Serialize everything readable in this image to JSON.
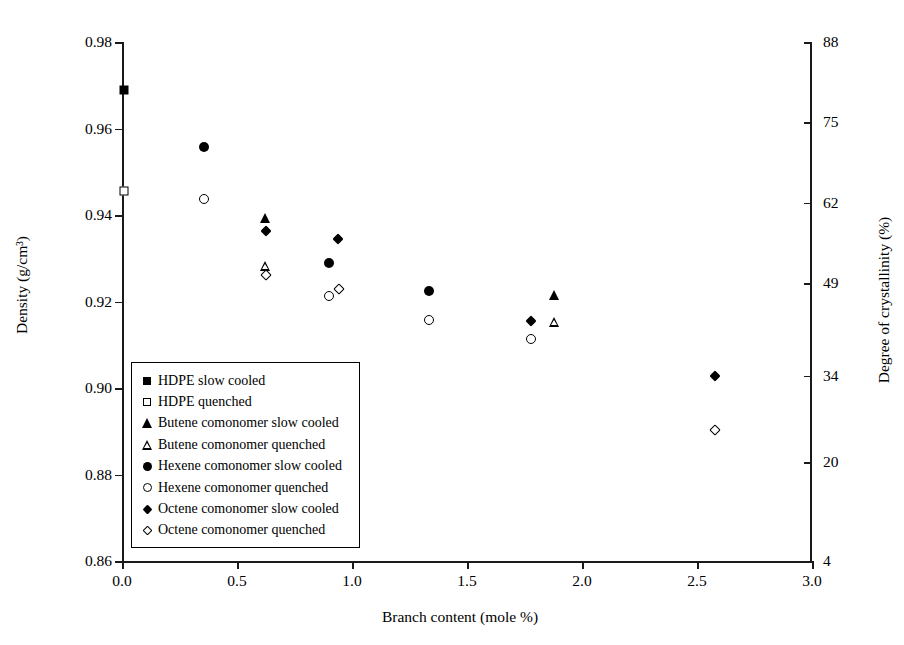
{
  "chart_data": {
    "type": "scatter",
    "title": "",
    "xlabel": "Branch content (mole %)",
    "ylabel": "Density (g/cm³)",
    "y2label": "Degree of crystallinity (%)",
    "xlim": [
      0.0,
      3.0
    ],
    "ylim": [
      0.86,
      0.98
    ],
    "y2lim": [
      4,
      88
    ],
    "xticks": [
      "0.0",
      "0.5",
      "1.0",
      "1.5",
      "2.0",
      "2.5",
      "3.0"
    ],
    "xtick_values": [
      0.0,
      0.5,
      1.0,
      1.5,
      2.0,
      2.5,
      3.0
    ],
    "yticks": [
      "0.86",
      "0.88",
      "0.90",
      "0.92",
      "0.94",
      "0.96",
      "0.98"
    ],
    "ytick_values": [
      0.86,
      0.88,
      0.9,
      0.92,
      0.94,
      0.96,
      0.98
    ],
    "y2ticks": [
      "4",
      "20",
      "34",
      "49",
      "62",
      "75",
      "88"
    ],
    "y2tick_values": [
      4,
      20,
      34,
      49,
      62,
      75,
      88
    ],
    "grid": false,
    "legend_position": "lower-left-inside",
    "series": [
      {
        "name": "HDPE slow cooled",
        "marker": "square-filled",
        "points": [
          {
            "x": 0.01,
            "y": 0.9688
          }
        ]
      },
      {
        "name": "HDPE quenched",
        "marker": "square-open",
        "points": [
          {
            "x": 0.01,
            "y": 0.9455
          }
        ]
      },
      {
        "name": "Butene comonomer slow cooled",
        "marker": "triangle-filled",
        "points": [
          {
            "x": 0.62,
            "y": 0.9393
          },
          {
            "x": 1.88,
            "y": 0.9215
          }
        ]
      },
      {
        "name": "Butene comonomer quenched",
        "marker": "triangle-open",
        "points": [
          {
            "x": 0.62,
            "y": 0.9283
          },
          {
            "x": 1.88,
            "y": 0.9153
          }
        ]
      },
      {
        "name": "Hexene comonomer slow cooled",
        "marker": "circle-filled",
        "points": [
          {
            "x": 0.355,
            "y": 0.9558
          },
          {
            "x": 0.9,
            "y": 0.9288
          },
          {
            "x": 1.335,
            "y": 0.9225
          }
        ]
      },
      {
        "name": "Hexene comonomer quenched",
        "marker": "circle-open",
        "points": [
          {
            "x": 0.355,
            "y": 0.9438
          },
          {
            "x": 0.9,
            "y": 0.9213
          },
          {
            "x": 1.335,
            "y": 0.9157
          },
          {
            "x": 1.78,
            "y": 0.9113
          }
        ]
      },
      {
        "name": "Octene comonomer slow cooled",
        "marker": "diamond-filled",
        "points": [
          {
            "x": 0.625,
            "y": 0.9363
          },
          {
            "x": 0.94,
            "y": 0.9345
          },
          {
            "x": 1.78,
            "y": 0.9155
          },
          {
            "x": 2.58,
            "y": 0.9028
          }
        ]
      },
      {
        "name": "Octene comonomer quenched",
        "marker": "diamond-open",
        "points": [
          {
            "x": 0.625,
            "y": 0.9262
          },
          {
            "x": 0.945,
            "y": 0.9228
          },
          {
            "x": 2.58,
            "y": 0.8903
          }
        ]
      }
    ]
  }
}
